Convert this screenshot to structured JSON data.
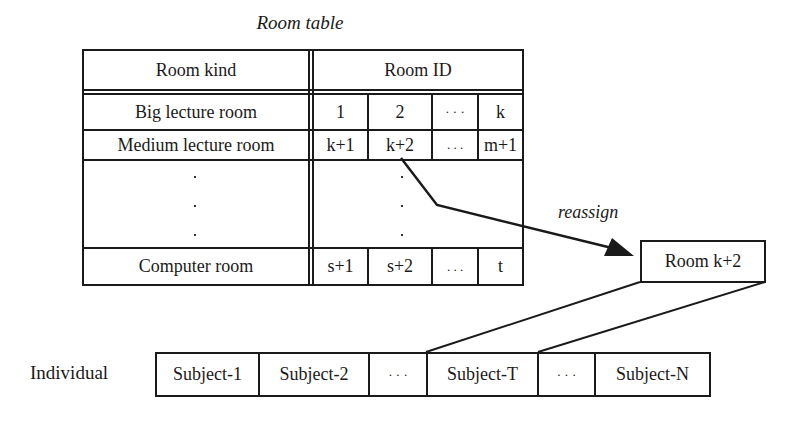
{
  "title": "Room table",
  "room_table": {
    "headers": {
      "kind": "Room kind",
      "id": "Room ID"
    },
    "rows": [
      {
        "kind": "Big lecture room",
        "ids": [
          "1",
          "2",
          "· · ·",
          "k"
        ]
      },
      {
        "kind": "Medium lecture room",
        "ids": [
          "k+1",
          "k+2",
          ". . .",
          "m+1"
        ]
      },
      {
        "kind": "·\n·\n·",
        "ids": [
          "",
          "·\n·\n·",
          "",
          ""
        ]
      },
      {
        "kind": "Computer room",
        "ids": [
          "s+1",
          "s+2",
          ". . .",
          "t"
        ]
      }
    ]
  },
  "arrow_label": "reassign",
  "selected_room": "Room k+2",
  "individual": {
    "label": "Individual",
    "cells": [
      "Subject-1",
      "Subject-2",
      "· · ·",
      "Subject-T",
      "· · ·",
      "Subject-N"
    ]
  }
}
